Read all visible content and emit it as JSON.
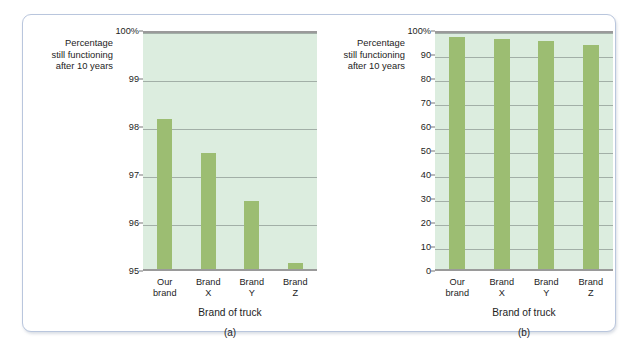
{
  "figure": {
    "frame_color": "#b9c6dd",
    "background": "#ffffff",
    "bar_color": "#9cbd72",
    "plot_background": "#dceddf",
    "gridline_color": "#8f9a94"
  },
  "chart_data": [
    {
      "type": "bar",
      "panel": "a",
      "caption": "(a)",
      "title": "",
      "ylabel": "Percentage\nstill functioning\nafter 10 years",
      "ylabel_lines": [
        "Percentage",
        "still functioning",
        "after 10 years"
      ],
      "xlabel": "Brand of truck",
      "categories": [
        "Our brand",
        "Brand X",
        "Brand Y",
        "Brand Z"
      ],
      "category_lines": [
        [
          "Our",
          "brand"
        ],
        [
          "Brand",
          "X"
        ],
        [
          "Brand",
          "Y"
        ],
        [
          "Brand",
          "Z"
        ]
      ],
      "values": [
        98.2,
        97.5,
        96.5,
        95.2
      ],
      "ylim": [
        95,
        100
      ],
      "yticks": [
        95,
        96,
        97,
        98,
        99,
        100
      ],
      "ytick_labels": [
        "95",
        "96",
        "97",
        "98",
        "99",
        "100%"
      ],
      "grid": true,
      "legend": "none"
    },
    {
      "type": "bar",
      "panel": "b",
      "caption": "(b)",
      "title": "",
      "ylabel": "Percentage\nstill functioning\nafter 10 years",
      "ylabel_lines": [
        "Percentage",
        "still functioning",
        "after 10 years"
      ],
      "xlabel": "Brand of truck",
      "categories": [
        "Our brand",
        "Brand X",
        "Brand Y",
        "Brand Z"
      ],
      "category_lines": [
        [
          "Our",
          "brand"
        ],
        [
          "Brand",
          "X"
        ],
        [
          "Brand",
          "Y"
        ],
        [
          "Brand",
          "Z"
        ]
      ],
      "values": [
        98.2,
        97.5,
        96.5,
        95.2
      ],
      "ylim": [
        0,
        100
      ],
      "yticks": [
        0,
        10,
        20,
        30,
        40,
        50,
        60,
        70,
        80,
        90,
        100
      ],
      "ytick_labels": [
        "0",
        "10",
        "20",
        "30",
        "40",
        "50",
        "60",
        "70",
        "80",
        "90",
        "100%"
      ],
      "grid": true,
      "legend": "none"
    }
  ]
}
